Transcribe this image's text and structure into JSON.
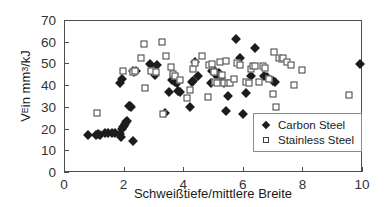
{
  "chart_data": {
    "type": "scatter",
    "title": "",
    "xlabel": "Schweißtiefe/mittlere Breite",
    "ylabel": "V_E in mm^3/kJ",
    "ylabel_parts": {
      "main": "V",
      "sub": "E",
      "mid": " in mm",
      "sup": "3",
      "tail": "/kJ"
    },
    "xlim": [
      0,
      10
    ],
    "ylim": [
      0,
      70
    ],
    "xticks": [
      0,
      2,
      4,
      6,
      8,
      10
    ],
    "yticks": [
      0,
      10,
      20,
      30,
      40,
      50,
      60,
      70
    ],
    "xtick_labels": [
      "0",
      "2",
      "4",
      "6",
      "8",
      "10"
    ],
    "ytick_labels": [
      "0",
      "10",
      "20",
      "30",
      "40",
      "50",
      "60",
      "70"
    ],
    "grid": false,
    "legend_position": "lower-right",
    "series": [
      {
        "name": "Carbon Steel",
        "marker": "filled-diamond",
        "color": "#1c1c1c",
        "points": [
          [
            0.82,
            17.2
          ],
          [
            1.08,
            16.9
          ],
          [
            1.15,
            17.4
          ],
          [
            1.22,
            17.2
          ],
          [
            1.38,
            18.0
          ],
          [
            1.46,
            18.1
          ],
          [
            1.62,
            18.0
          ],
          [
            1.72,
            18.1
          ],
          [
            1.88,
            17.6
          ],
          [
            1.9,
            16.3
          ],
          [
            1.95,
            19.6
          ],
          [
            1.98,
            20.8
          ],
          [
            2.02,
            21.4
          ],
          [
            2.05,
            22.3
          ],
          [
            2.08,
            23.0
          ],
          [
            2.12,
            23.4
          ],
          [
            2.18,
            30.4
          ],
          [
            2.22,
            30.6
          ],
          [
            2.26,
            29.9
          ],
          [
            2.32,
            14.4
          ],
          [
            1.88,
            41.2
          ],
          [
            1.95,
            42.6
          ],
          [
            2.3,
            46.6
          ],
          [
            2.36,
            46.1
          ],
          [
            2.42,
            46.3
          ],
          [
            2.9,
            49.9
          ],
          [
            2.96,
            47.2
          ],
          [
            3.05,
            44.6
          ],
          [
            3.12,
            49.4
          ],
          [
            3.4,
            27.3
          ],
          [
            3.52,
            36.9
          ],
          [
            3.62,
            42.3
          ],
          [
            3.68,
            44.8
          ],
          [
            3.72,
            41.5
          ],
          [
            3.78,
            41.0
          ],
          [
            3.82,
            37.2
          ],
          [
            3.9,
            36.7
          ],
          [
            4.22,
            30.1
          ],
          [
            4.28,
            41.3
          ],
          [
            4.32,
            42.0
          ],
          [
            4.4,
            50.6
          ],
          [
            4.48,
            44.2
          ],
          [
            4.92,
            40.8
          ],
          [
            4.98,
            46.4
          ],
          [
            5.05,
            47.0
          ],
          [
            5.12,
            44.3
          ],
          [
            5.2,
            45.8
          ],
          [
            5.28,
            43.2
          ],
          [
            5.38,
            41.2
          ],
          [
            5.44,
            27.9
          ],
          [
            5.52,
            35.2
          ],
          [
            5.78,
            61.4
          ],
          [
            5.92,
            52.5
          ],
          [
            6.02,
            26.5
          ],
          [
            6.1,
            36.2
          ],
          [
            6.28,
            44.4
          ],
          [
            6.4,
            56.9
          ],
          [
            6.72,
            44.2
          ],
          [
            6.8,
            43.8
          ],
          [
            7.02,
            41.8
          ],
          [
            7.08,
            41.3
          ],
          [
            9.92,
            49.7
          ]
        ]
      },
      {
        "name": "Stainless Steel",
        "marker": "open-square",
        "color": "#3d3d3d",
        "points": [
          [
            1.12,
            27.4
          ],
          [
            1.98,
            46.5
          ],
          [
            2.32,
            46.0
          ],
          [
            2.38,
            46.3
          ],
          [
            2.58,
            52.3
          ],
          [
            2.68,
            58.9
          ],
          [
            2.72,
            38.9
          ],
          [
            2.92,
            46.4
          ],
          [
            3.08,
            46.1
          ],
          [
            3.28,
            59.9
          ],
          [
            3.32,
            26.8
          ],
          [
            3.42,
            53.3
          ],
          [
            3.58,
            48.4
          ],
          [
            3.66,
            45.2
          ],
          [
            3.74,
            44.0
          ],
          [
            3.88,
            42.2
          ],
          [
            4.12,
            33.9
          ],
          [
            4.22,
            37.6
          ],
          [
            4.32,
            47.3
          ],
          [
            4.4,
            50.2
          ],
          [
            4.62,
            53.5
          ],
          [
            4.82,
            34.6
          ],
          [
            4.88,
            49.2
          ],
          [
            4.96,
            49.8
          ],
          [
            5.02,
            46.0
          ],
          [
            5.08,
            41.4
          ],
          [
            5.14,
            41.0
          ],
          [
            5.22,
            50.6
          ],
          [
            5.3,
            44.9
          ],
          [
            5.36,
            41.2
          ],
          [
            5.44,
            51.0
          ],
          [
            5.52,
            41.1
          ],
          [
            5.58,
            40.9
          ],
          [
            5.7,
            43.0
          ],
          [
            5.8,
            50.0
          ],
          [
            5.92,
            49.5
          ],
          [
            6.1,
            41.4
          ],
          [
            6.2,
            40.8
          ],
          [
            6.28,
            47.3
          ],
          [
            6.34,
            49.0
          ],
          [
            6.42,
            48.6
          ],
          [
            6.56,
            41.4
          ],
          [
            6.68,
            48.9
          ],
          [
            6.76,
            47.8
          ],
          [
            6.88,
            42.6
          ],
          [
            7.0,
            35.9
          ],
          [
            7.06,
            55.4
          ],
          [
            7.12,
            30.1
          ],
          [
            7.22,
            52.6
          ],
          [
            7.3,
            52.0
          ],
          [
            7.36,
            52.3
          ],
          [
            7.48,
            50.7
          ],
          [
            7.62,
            49.3
          ],
          [
            7.72,
            40.0
          ],
          [
            7.98,
            46.8
          ],
          [
            9.55,
            35.4
          ]
        ]
      }
    ]
  },
  "legend": {
    "items": [
      {
        "label": "Carbon Steel",
        "marker": "filled-diamond"
      },
      {
        "label": "Stainless Steel",
        "marker": "open-square"
      }
    ]
  }
}
